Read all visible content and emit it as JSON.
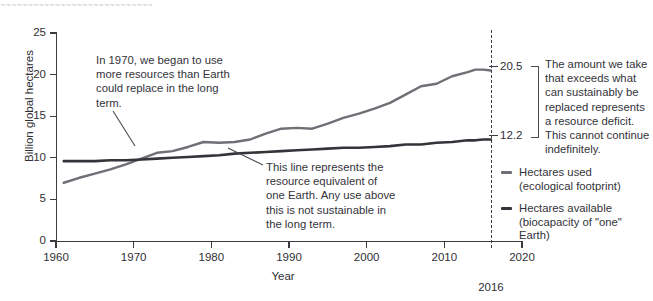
{
  "header": {
    "cropped_text": "~~~~~~~~~~~~~~~~~~~~~~~~~~~~"
  },
  "axes": {
    "y_title": "Billion global hectares",
    "x_title": "Year",
    "y_ticks": [
      "0",
      "5",
      "10",
      "15",
      "20",
      "25"
    ],
    "x_ticks": [
      "1960",
      "1970",
      "1980",
      "1990",
      "2000",
      "2010",
      "2020"
    ]
  },
  "marker": {
    "year_label": "2016"
  },
  "endpoints": {
    "footprint_value": "20.5",
    "biocapacity_value": "12.2"
  },
  "annotations": {
    "crossover": "In 1970, we began to use more resources than Earth could replace in the long term.",
    "biocapacity_line": "This line represents the resource equivalent of one Earth. Any use above this is not sustainable in the long term.",
    "deficit": "The amount we take that exceeds what can sustainably be replaced represents a resource deficit. This cannot continue indefinitely."
  },
  "legend": {
    "items": [
      {
        "label": "Hectares used",
        "sublabel": "(ecological footprint)",
        "color": "#6f6f76"
      },
      {
        "label": "Hectares available",
        "sublabel": "(biocapacity of \"one\" Earth)",
        "color": "#34343a"
      }
    ]
  },
  "chart_data": {
    "type": "line",
    "title": "",
    "xlabel": "Year",
    "ylabel": "Billion global hectares",
    "xlim": [
      1960,
      2020
    ],
    "ylim": [
      0,
      25
    ],
    "grid": false,
    "legend_position": "right",
    "annotation_marker_x": 2016,
    "x": [
      1961,
      1963,
      1965,
      1967,
      1969,
      1971,
      1973,
      1975,
      1977,
      1979,
      1981,
      1983,
      1985,
      1987,
      1989,
      1991,
      1993,
      1995,
      1997,
      1999,
      2001,
      2003,
      2005,
      2007,
      2009,
      2011,
      2013,
      2014,
      2015,
      2016
    ],
    "series": [
      {
        "name": "Hectares used (ecological footprint)",
        "color": "#6f6f76",
        "values": [
          7.0,
          7.6,
          8.1,
          8.6,
          9.2,
          9.9,
          10.6,
          10.8,
          11.3,
          11.9,
          11.8,
          11.9,
          12.2,
          12.9,
          13.5,
          13.6,
          13.5,
          14.1,
          14.8,
          15.3,
          15.9,
          16.6,
          17.6,
          18.6,
          18.9,
          19.8,
          20.3,
          20.6,
          20.6,
          20.5
        ]
      },
      {
        "name": "Hectares available (biocapacity of \"one\" Earth)",
        "color": "#34343a",
        "values": [
          9.6,
          9.6,
          9.6,
          9.7,
          9.7,
          9.8,
          9.9,
          10.0,
          10.1,
          10.2,
          10.3,
          10.5,
          10.6,
          10.7,
          10.8,
          10.9,
          11.0,
          11.1,
          11.2,
          11.2,
          11.3,
          11.4,
          11.6,
          11.6,
          11.8,
          11.9,
          12.1,
          12.1,
          12.2,
          12.2
        ]
      }
    ],
    "endpoint_labels": {
      "footprint": 20.5,
      "biocapacity": 12.2
    }
  }
}
